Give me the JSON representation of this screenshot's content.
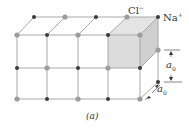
{
  "figure": {
    "labels": {
      "cl": "Cl",
      "cl_sup": "−",
      "na": "Na",
      "na_sup": "+",
      "a0_vertical": "a",
      "a0_vertical_sub": "0",
      "a0_depth": "a",
      "a0_depth_sub": "0",
      "caption": "(a)"
    },
    "colors": {
      "cl_ion": "#9c9c9c",
      "na_ion": "#3a3a3a",
      "edge": "#a8a8a8",
      "shaded_cell": "#dcdcdc"
    }
  }
}
